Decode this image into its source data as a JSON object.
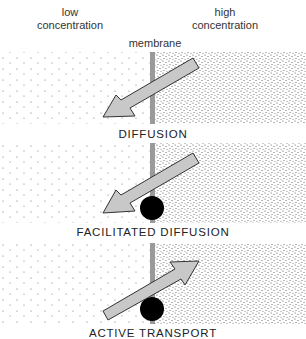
{
  "header": {
    "low_label_line1": "low",
    "low_label_line2": "concentration",
    "high_label_line1": "high",
    "high_label_line2": "concentration",
    "membrane_label": "membrane"
  },
  "panels": [
    {
      "caption": "DIFFUSION",
      "arrow_direction": "high-to-low",
      "carrier_protein": false
    },
    {
      "caption": "FACILITATED DIFFUSION",
      "arrow_direction": "high-to-low",
      "carrier_protein": true
    },
    {
      "caption": "ACTIVE TRANSPORT",
      "arrow_direction": "low-to-high",
      "carrier_protein": true
    }
  ],
  "colors": {
    "membrane": "#9a9a9a",
    "arrow_fill": "#c8c8c8",
    "arrow_stroke": "#333333",
    "carrier": "#000000",
    "dots": "#555555"
  }
}
